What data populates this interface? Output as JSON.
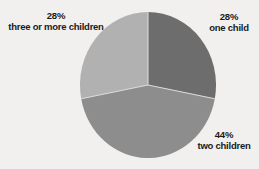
{
  "chart_data": {
    "type": "pie",
    "title": "",
    "subtitle": "",
    "xlabel": "",
    "ylabel": "",
    "grid": false,
    "legend_position": "none",
    "label_format": "percent-above-category",
    "start_angle_deg": 0,
    "direction": "clockwise",
    "categories": [
      "one child",
      "two children",
      "three or more children"
    ],
    "values": [
      28,
      44,
      28
    ],
    "value_labels": [
      "28%",
      "44%",
      "28%"
    ],
    "slice_colors": [
      "#6d6d6d",
      "#8d8d8d",
      "#b1b1b1"
    ],
    "slices": [
      {
        "category": "one child",
        "value": 28,
        "value_label": "28%",
        "color": "#6d6d6d",
        "start_deg": 0,
        "end_deg": 100.8,
        "label_position": "right-top"
      },
      {
        "category": "two children",
        "value": 44,
        "value_label": "44%",
        "color": "#8d8d8d",
        "start_deg": 100.8,
        "end_deg": 259.2,
        "label_position": "right-bottom"
      },
      {
        "category": "three or more children",
        "value": 28,
        "value_label": "28%",
        "color": "#b1b1b1",
        "start_deg": 259.2,
        "end_deg": 360,
        "label_position": "left-top"
      }
    ]
  },
  "labels": {
    "one_child": {
      "percent": "28%",
      "category": "one child"
    },
    "two_children": {
      "percent": "44%",
      "category": "two children"
    },
    "three_or_more_children": {
      "percent": "28%",
      "category": "three or more children"
    }
  },
  "colors": {
    "background": "#f1f0ee",
    "text": "#1a1a1a",
    "slice_one_child": "#6d6d6d",
    "slice_two_children": "#8d8d8d",
    "slice_three_or_more": "#b1b1b1",
    "slice_divider": "#d8d8d6"
  }
}
